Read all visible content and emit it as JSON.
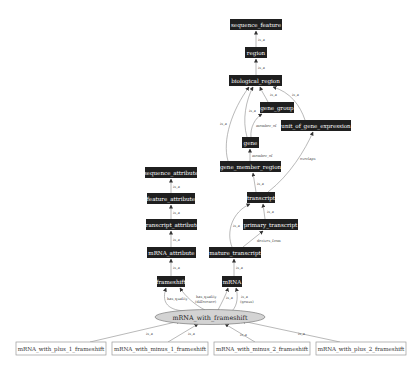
{
  "diagram": {
    "type": "ontology-graph",
    "nodes": {
      "sequence_feature": "sequence_feature",
      "region": "region",
      "biological_region": "biological_region",
      "gene_group": "gene_group",
      "unit_of_gene_expression": "unit_of_gene_expression",
      "gene": "gene",
      "gene_member_region": "gene_member_region",
      "transcript": "transcript",
      "primary_transcript": "primary_transcript",
      "mature_transcript": "mature_transcript",
      "mRNA": "mRNA",
      "sequence_attribute": "sequence_attribute",
      "feature_attribute": "feature_attribute",
      "transcript_attribute": "transcript_attribute",
      "mRNA_attribute": "mRNA_attribute",
      "frameshift": "frameshift",
      "mRNA_with_frameshift": "mRNA_with_frameshift",
      "mRNA_with_plus_1_frameshift": "mRNA_with_plus_1_frameshift",
      "mRNA_with_minus_1_frameshift": "mRNA_with_minus_1_frameshift",
      "mRNA_with_minus_2_frameshift": "mRNA_with_minus_2_frameshift",
      "mRNA_with_plus_2_frameshift": "mRNA_with_plus_2_frameshift"
    },
    "edge_labels": {
      "is_a": "is_a",
      "member_of": "member_of",
      "overlaps": "overlaps",
      "derives_from": "derives_from",
      "has_quality": "has_quality",
      "has_quality_l1": "has_quality",
      "has_quality_l2": "(difference)",
      "is_a_genus_l1": "is_a",
      "is_a_genus_l2": "(genus)"
    },
    "edges": [
      {
        "from": "region",
        "to": "sequence_feature",
        "label": "is_a"
      },
      {
        "from": "biological_region",
        "to": "region",
        "label": "is_a"
      },
      {
        "from": "gene_group",
        "to": "biological_region",
        "label": "is_a"
      },
      {
        "from": "unit_of_gene_expression",
        "to": "biological_region",
        "label": "is_a"
      },
      {
        "from": "gene",
        "to": "biological_region",
        "label": "is_a"
      },
      {
        "from": "gene",
        "to": "gene_group",
        "label": "member_of"
      },
      {
        "from": "gene_member_region",
        "to": "biological_region",
        "label": "is_a"
      },
      {
        "from": "gene_member_region",
        "to": "gene",
        "label": "member_of"
      },
      {
        "from": "transcript",
        "to": "gene_member_region",
        "label": "is_a"
      },
      {
        "from": "transcript",
        "to": "unit_of_gene_expression",
        "label": "overlaps"
      },
      {
        "from": "primary_transcript",
        "to": "transcript",
        "label": "is_a"
      },
      {
        "from": "mature_transcript",
        "to": "transcript",
        "label": "is_a"
      },
      {
        "from": "mature_transcript",
        "to": "primary_transcript",
        "label": "derives_from"
      },
      {
        "from": "mRNA",
        "to": "mature_transcript",
        "label": "is_a"
      },
      {
        "from": "feature_attribute",
        "to": "sequence_attribute",
        "label": "is_a"
      },
      {
        "from": "transcript_attribute",
        "to": "feature_attribute",
        "label": "is_a"
      },
      {
        "from": "mRNA_attribute",
        "to": "transcript_attribute",
        "label": "is_a"
      },
      {
        "from": "frameshift",
        "to": "mRNA_attribute",
        "label": "is_a"
      },
      {
        "from": "mRNA_with_frameshift",
        "to": "frameshift",
        "label": "has_quality"
      },
      {
        "from": "mRNA_with_frameshift",
        "to": "frameshift",
        "label": "has_quality (difference)"
      },
      {
        "from": "mRNA_with_frameshift",
        "to": "mRNA",
        "label": "is_a"
      },
      {
        "from": "mRNA_with_frameshift",
        "to": "mRNA",
        "label": "is_a (genus)"
      },
      {
        "from": "mRNA_with_plus_1_frameshift",
        "to": "mRNA_with_frameshift",
        "label": "is_a"
      },
      {
        "from": "mRNA_with_minus_1_frameshift",
        "to": "mRNA_with_frameshift",
        "label": "is_a"
      },
      {
        "from": "mRNA_with_minus_2_frameshift",
        "to": "mRNA_with_frameshift",
        "label": "is_a"
      },
      {
        "from": "mRNA_with_plus_2_frameshift",
        "to": "mRNA_with_frameshift",
        "label": "is_a"
      }
    ],
    "colors": {
      "dark_node": "#1f1f1f",
      "focus_node": "#d3d3d3",
      "edge": "#8a8a8a"
    }
  }
}
